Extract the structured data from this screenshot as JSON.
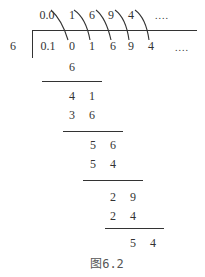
{
  "divisor": "6",
  "quotient": {
    "lead": "0.0",
    "digits": [
      "1",
      "6",
      "9",
      "4"
    ],
    "ellipsis": "...."
  },
  "dividend": {
    "lead": "0.1",
    "digits": [
      "0",
      "1",
      "6",
      "9",
      "4"
    ],
    "ellipsis": "...."
  },
  "steps": [
    {
      "row": [
        "6"
      ]
    },
    {
      "row": [
        "4",
        "1"
      ]
    },
    {
      "row": [
        "3",
        "6"
      ]
    },
    {
      "row": [
        "5",
        "6"
      ]
    },
    {
      "row": [
        "5",
        "4"
      ]
    },
    {
      "row": [
        "2",
        "9"
      ]
    },
    {
      "row": [
        "2",
        "4"
      ]
    },
    {
      "row": [
        "5",
        "4"
      ]
    }
  ],
  "caption": "图6.2",
  "colors": {
    "ink": "#333333",
    "background": "#ffffff"
  }
}
